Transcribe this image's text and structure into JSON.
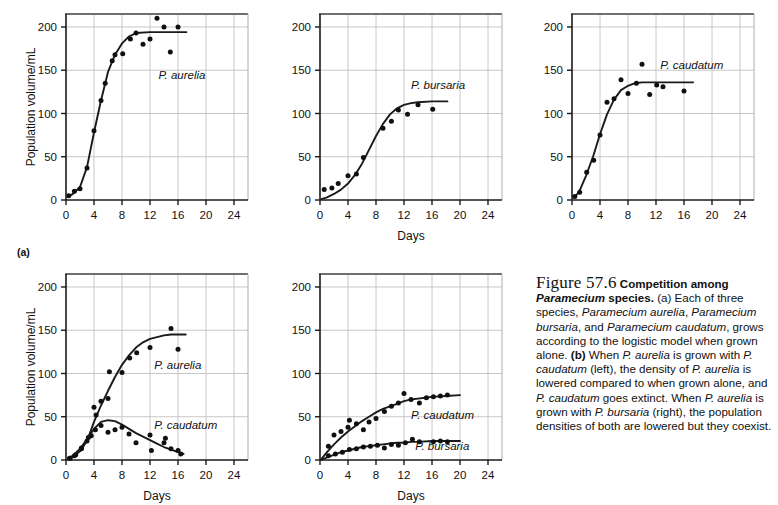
{
  "figure": {
    "row_labels": [
      {
        "text": "(a)"
      }
    ],
    "axis": {
      "xlabel": "Days",
      "ylabel": "Population volume/mL",
      "xticks": [
        0,
        4,
        8,
        12,
        16,
        20,
        24
      ],
      "yticks": [
        0,
        50,
        100,
        150,
        200
      ],
      "xlim": [
        0,
        26
      ],
      "ylim": [
        0,
        215
      ]
    }
  },
  "caption": {
    "figure_number": "Figure 57.6",
    "title": "Competition among Paramecium species.",
    "part_a": "(a) Each of three species, Paramecium aurelia, Paramecium bursaria, and Paramecium caudatum, grows according to the logistic model when grown alone.",
    "part_b": "(b) When P. aurelia is grown with P. caudatum (left), the density of P. aurelia is lowered compared to when grown alone, and P. caudatum goes extinct. When P. aurelia is grown with P. bursaria (right), the population densities of both are lowered but they coexist."
  },
  "chart_data": [
    {
      "id": "aurelia-alone",
      "type": "scatter",
      "title": "",
      "xlabel": "",
      "ylabel": "Population volume/mL",
      "xlim": [
        0,
        26
      ],
      "ylim": [
        0,
        215
      ],
      "xticks": [
        0,
        4,
        8,
        12,
        16,
        20,
        24
      ],
      "yticks": [
        0,
        50,
        100,
        150,
        200
      ],
      "grid": true,
      "series": [
        {
          "name": "P. aurelia",
          "label_pos": [
            13.2,
            140
          ],
          "carrying_capacity": 195,
          "points": [
            [
              0.4,
              5
            ],
            [
              1.2,
              10
            ],
            [
              2.0,
              13
            ],
            [
              3.0,
              37
            ],
            [
              4.0,
              80
            ],
            [
              5.0,
              115
            ],
            [
              5.6,
              135
            ],
            [
              6.6,
              161
            ],
            [
              7.0,
              168
            ],
            [
              8.1,
              169
            ],
            [
              9.2,
              186
            ],
            [
              10.0,
              193
            ],
            [
              11.0,
              180
            ],
            [
              12.0,
              186
            ],
            [
              13.0,
              210
            ],
            [
              14.0,
              200
            ],
            [
              14.9,
              171
            ],
            [
              16.0,
              200
            ]
          ],
          "fit": [
            [
              0.3,
              4
            ],
            [
              1,
              7
            ],
            [
              2,
              15
            ],
            [
              3,
              38
            ],
            [
              4,
              78
            ],
            [
              5,
              115
            ],
            [
              6,
              148
            ],
            [
              7,
              168
            ],
            [
              8,
              181
            ],
            [
              9,
              189
            ],
            [
              10,
              193
            ],
            [
              12,
              194
            ],
            [
              14,
              194
            ],
            [
              17.2,
              194
            ]
          ]
        }
      ]
    },
    {
      "id": "bursaria-alone",
      "type": "scatter",
      "title": "",
      "xlabel": "Days",
      "ylabel": "",
      "xlim": [
        0,
        26
      ],
      "ylim": [
        0,
        215
      ],
      "xticks": [
        0,
        4,
        8,
        12,
        16,
        20,
        24
      ],
      "yticks": [
        0,
        50,
        100,
        150,
        200
      ],
      "grid": true,
      "series": [
        {
          "name": "P. bursaria",
          "label_pos": [
            13.0,
            128
          ],
          "carrying_capacity": 113,
          "points": [
            [
              0.6,
              12
            ],
            [
              1.7,
              14
            ],
            [
              2.6,
              19
            ],
            [
              4.0,
              28
            ],
            [
              5.2,
              30
            ],
            [
              6.2,
              49
            ],
            [
              9.0,
              83
            ],
            [
              10.2,
              91
            ],
            [
              11.2,
              104
            ],
            [
              12.5,
              99
            ],
            [
              14.0,
              110
            ],
            [
              16.1,
              105
            ]
          ],
          "fit": [
            [
              0.2,
              1
            ],
            [
              1,
              3
            ],
            [
              2,
              7
            ],
            [
              3,
              12
            ],
            [
              4,
              19
            ],
            [
              5,
              29
            ],
            [
              6,
              42
            ],
            [
              7,
              58
            ],
            [
              8,
              74
            ],
            [
              9,
              88
            ],
            [
              10,
              99
            ],
            [
              11,
              106
            ],
            [
              12,
              110
            ],
            [
              13,
              112
            ],
            [
              14,
              113
            ],
            [
              16,
              114
            ],
            [
              18.2,
              114
            ]
          ]
        }
      ]
    },
    {
      "id": "caudatum-alone",
      "type": "scatter",
      "title": "",
      "xlabel": "",
      "ylabel": "",
      "xlim": [
        0,
        26
      ],
      "ylim": [
        0,
        215
      ],
      "xticks": [
        0,
        4,
        8,
        12,
        16,
        20,
        24
      ],
      "yticks": [
        0,
        50,
        100,
        150,
        200
      ],
      "grid": true,
      "series": [
        {
          "name": "P. caudatum",
          "label_pos": [
            12.6,
            152
          ],
          "carrying_capacity": 135,
          "points": [
            [
              0.4,
              4
            ],
            [
              1.1,
              9
            ],
            [
              2.1,
              32
            ],
            [
              3.1,
              46
            ],
            [
              4.0,
              75
            ],
            [
              5.0,
              113
            ],
            [
              6.0,
              117
            ],
            [
              7.0,
              139
            ],
            [
              8.0,
              123
            ],
            [
              9.2,
              135
            ],
            [
              10.0,
              157
            ],
            [
              11.1,
              122
            ],
            [
              12.1,
              133
            ],
            [
              13.0,
              131
            ],
            [
              16.0,
              126
            ]
          ],
          "fit": [
            [
              0.3,
              3
            ],
            [
              1,
              9
            ],
            [
              2,
              28
            ],
            [
              3,
              50
            ],
            [
              4,
              76
            ],
            [
              5,
              99
            ],
            [
              6,
              116
            ],
            [
              7,
              127
            ],
            [
              8,
              132
            ],
            [
              9,
              135
            ],
            [
              10,
              136
            ],
            [
              12,
              136
            ],
            [
              14,
              136
            ],
            [
              17.3,
              136
            ]
          ]
        }
      ]
    },
    {
      "id": "aurelia-with-caudatum",
      "type": "scatter",
      "title": "",
      "xlabel": "Days",
      "ylabel": "Population volume/mL",
      "xlim": [
        0,
        26
      ],
      "ylim": [
        0,
        215
      ],
      "xticks": [
        0,
        4,
        8,
        12,
        16,
        20,
        24
      ],
      "yticks": [
        0,
        50,
        100,
        150,
        200
      ],
      "grid": true,
      "series": [
        {
          "name": "P. aurelia",
          "label_pos": [
            12.6,
            105
          ],
          "carrying_capacity": 145,
          "points": [
            [
              0.5,
              2
            ],
            [
              1.2,
              5
            ],
            [
              2.2,
              13
            ],
            [
              3.2,
              26
            ],
            [
              4.0,
              61
            ],
            [
              4.3,
              52
            ],
            [
              5.0,
              68
            ],
            [
              6.0,
              71
            ],
            [
              6.2,
              102
            ],
            [
              8.0,
              101
            ],
            [
              9.1,
              118
            ],
            [
              10.1,
              124
            ],
            [
              12.0,
              130
            ],
            [
              15.0,
              152
            ],
            [
              16.0,
              128
            ]
          ],
          "fit": [
            [
              0.3,
              2
            ],
            [
              1,
              4
            ],
            [
              2,
              10
            ],
            [
              3,
              22
            ],
            [
              4,
              44
            ],
            [
              5,
              63
            ],
            [
              6,
              80
            ],
            [
              7,
              96
            ],
            [
              8,
              110
            ],
            [
              9,
              121
            ],
            [
              10,
              130
            ],
            [
              11,
              136
            ],
            [
              12,
              140
            ],
            [
              13,
              142
            ],
            [
              14,
              144
            ],
            [
              15,
              145
            ],
            [
              17.1,
              145
            ]
          ]
        },
        {
          "name": "P. caudatum",
          "label_pos": [
            12.6,
            36
          ],
          "carrying_capacity": 0,
          "points": [
            [
              0.6,
              2
            ],
            [
              1.4,
              6
            ],
            [
              2.2,
              14
            ],
            [
              3.0,
              22
            ],
            [
              3.6,
              28
            ],
            [
              4.2,
              35
            ],
            [
              5.0,
              40
            ],
            [
              6.0,
              32
            ],
            [
              7.0,
              35
            ],
            [
              8.0,
              38
            ],
            [
              9.0,
              30
            ],
            [
              10.0,
              20
            ],
            [
              12.0,
              29
            ],
            [
              12.2,
              11
            ],
            [
              14.0,
              20
            ],
            [
              14.2,
              25
            ],
            [
              15.0,
              13
            ],
            [
              16.0,
              11
            ],
            [
              16.4,
              7
            ]
          ],
          "fit": [
            [
              0.3,
              2
            ],
            [
              1,
              5
            ],
            [
              2,
              13
            ],
            [
              3,
              24
            ],
            [
              4,
              36
            ],
            [
              5,
              44
            ],
            [
              6,
              46
            ],
            [
              7,
              45
            ],
            [
              8,
              41
            ],
            [
              9,
              36
            ],
            [
              10,
              31
            ],
            [
              11,
              27
            ],
            [
              12,
              23
            ],
            [
              13,
              19
            ],
            [
              14,
              15
            ],
            [
              15,
              12
            ],
            [
              16,
              9
            ],
            [
              16.8,
              7
            ]
          ]
        }
      ]
    },
    {
      "id": "caudatum-with-bursaria",
      "type": "scatter",
      "title": "",
      "xlabel": "Days",
      "ylabel": "",
      "xlim": [
        0,
        26
      ],
      "ylim": [
        0,
        215
      ],
      "xticks": [
        0,
        4,
        8,
        12,
        16,
        20,
        24
      ],
      "yticks": [
        0,
        50,
        100,
        150,
        200
      ],
      "grid": true,
      "series": [
        {
          "name": "P. caudatum",
          "label_pos": [
            13.0,
            47
          ],
          "carrying_capacity": 75,
          "points": [
            [
              1.2,
              16
            ],
            [
              2.0,
              29
            ],
            [
              3.0,
              33
            ],
            [
              4.0,
              38
            ],
            [
              4.2,
              46
            ],
            [
              5.2,
              42
            ],
            [
              6.2,
              35
            ],
            [
              7.0,
              44
            ],
            [
              8.0,
              48
            ],
            [
              9.2,
              56
            ],
            [
              10.2,
              62
            ],
            [
              11.2,
              66
            ],
            [
              12.0,
              77
            ],
            [
              13.0,
              70
            ],
            [
              14.2,
              66
            ],
            [
              15.2,
              72
            ],
            [
              16.2,
              73
            ],
            [
              17.2,
              74
            ],
            [
              18.2,
              75
            ]
          ],
          "fit": [
            [
              0.2,
              1
            ],
            [
              1,
              9
            ],
            [
              2,
              18
            ],
            [
              3,
              26
            ],
            [
              4,
              33
            ],
            [
              5,
              39
            ],
            [
              6,
              45
            ],
            [
              7,
              50
            ],
            [
              8,
              55
            ],
            [
              9,
              59
            ],
            [
              10,
              62
            ],
            [
              11,
              65
            ],
            [
              12,
              68
            ],
            [
              13,
              70
            ],
            [
              14,
              71
            ],
            [
              15,
              72
            ],
            [
              16,
              73
            ],
            [
              18,
              74
            ],
            [
              20,
              75
            ]
          ]
        },
        {
          "name": "P. bursaria",
          "label_pos": [
            13.6,
            11
          ],
          "carrying_capacity": 22,
          "points": [
            [
              1.2,
              5
            ],
            [
              2.2,
              7
            ],
            [
              3.2,
              9
            ],
            [
              4.2,
              12
            ],
            [
              5.2,
              13
            ],
            [
              6.2,
              15
            ],
            [
              7.2,
              16
            ],
            [
              8.2,
              17
            ],
            [
              9.2,
              14
            ],
            [
              10.2,
              18
            ],
            [
              11.2,
              17
            ],
            [
              12.2,
              20
            ],
            [
              13.2,
              24
            ],
            [
              14.2,
              21
            ],
            [
              16.2,
              21
            ],
            [
              17.2,
              22
            ],
            [
              18.2,
              21
            ]
          ],
          "fit": [
            [
              0.2,
              0
            ],
            [
              1,
              3
            ],
            [
              2,
              6
            ],
            [
              3,
              9
            ],
            [
              4,
              11
            ],
            [
              5,
              13
            ],
            [
              6,
              15
            ],
            [
              7,
              16
            ],
            [
              8,
              17
            ],
            [
              9,
              18
            ],
            [
              10,
              19
            ],
            [
              11,
              20
            ],
            [
              12,
              20
            ],
            [
              13,
              21
            ],
            [
              14,
              21
            ],
            [
              16,
              22
            ],
            [
              18,
              22
            ],
            [
              20,
              22
            ]
          ]
        }
      ]
    }
  ]
}
